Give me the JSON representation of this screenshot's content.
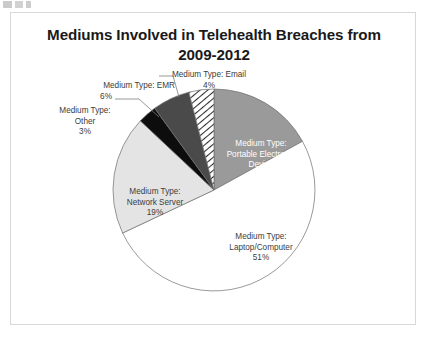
{
  "chart_data": {
    "type": "pie",
    "title": "Mediums Involved in Telehealth Breaches from 2009-2012",
    "title_line1": "Mediums Involved in Telehealth Breaches from",
    "title_line2": "2009-2012",
    "xlabel": "",
    "ylabel": "",
    "legend_position": "none",
    "grid": false,
    "value_unit": "percent",
    "categories": [
      "Medium Type: Portable Electronic Device",
      "Medium Type: Laptop/Computer",
      "Medium Type: Network Server",
      "Medium Type: Other",
      "Medium Type: EMR",
      "Medium Type: Email"
    ],
    "values": [
      17,
      51,
      19,
      3,
      6,
      4
    ],
    "slices": [
      {
        "name": "Medium Type: Portable Electronic Device",
        "label_line1": "Medium Type:",
        "label_line2": "Portable Electronic",
        "label_line3": "Device",
        "percent": "17%",
        "value": 17,
        "fill": "#9a9a9a",
        "pattern": "solid",
        "label_placement": "inside"
      },
      {
        "name": "Medium Type: Laptop/Computer",
        "label_line1": "Medium Type:",
        "label_line2": "Laptop/Computer",
        "percent": "51%",
        "value": 51,
        "fill": "#ffffff",
        "pattern": "solid",
        "label_placement": "inside"
      },
      {
        "name": "Medium Type: Network Server",
        "label_line1": "Medium Type:",
        "label_line2": "Network Server",
        "percent": "19%",
        "value": 19,
        "fill": "#e4e4e4",
        "pattern": "solid",
        "label_placement": "inside"
      },
      {
        "name": "Medium Type: Other",
        "label_line1": "Medium Type:",
        "label_line2": "Other",
        "percent": "3%",
        "value": 3,
        "fill": "#0d0d0d",
        "pattern": "solid",
        "label_placement": "callout"
      },
      {
        "name": "Medium Type: EMR",
        "label_line1": "Medium Type: EMR",
        "percent": "6%",
        "value": 6,
        "fill": "#4a4a4a",
        "pattern": "solid",
        "label_placement": "callout"
      },
      {
        "name": "Medium Type: Email",
        "label_line1": "Medium Type: Email",
        "percent": "4%",
        "value": 4,
        "fill": "#ffffff",
        "pattern": "diagonal-hatch",
        "label_placement": "callout"
      }
    ],
    "colors": {
      "portable_electronic_device": "#9a9a9a",
      "laptop_computer": "#ffffff",
      "network_server": "#e4e4e4",
      "other": "#0d0d0d",
      "emr": "#4a4a4a",
      "email_hatch_stroke": "#2b2b2b",
      "slice_outline": "#6f6f6f",
      "frame_border": "#d8d8d8",
      "title_text": "#1a1a1a",
      "label_text_dark": "#3b3b3b",
      "label_text_light": "#ffffff"
    }
  }
}
